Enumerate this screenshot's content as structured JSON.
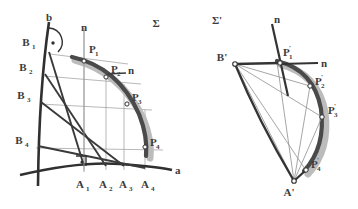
{
  "figure": {
    "kind": "descriptive-geometry-construction",
    "panels": [
      {
        "id": "left",
        "plane_label": "Σ",
        "axis_labels": {
          "horizontal": "a",
          "vertical": "b",
          "normal": "n",
          "normal_secondary": "n"
        },
        "b_points": [
          {
            "label": "B",
            "sub": "1"
          },
          {
            "label": "B",
            "sub": "2"
          },
          {
            "label": "B",
            "sub": "3"
          },
          {
            "label": "B",
            "sub": "4"
          }
        ],
        "a_points": [
          {
            "label": "A",
            "sub": "1"
          },
          {
            "label": "A",
            "sub": "2"
          },
          {
            "label": "A",
            "sub": "3"
          },
          {
            "label": "A",
            "sub": "4"
          }
        ],
        "curve_points": [
          {
            "label": "P",
            "sub": "1"
          },
          {
            "label": "P",
            "sub": "2"
          },
          {
            "label": "P",
            "sub": "3"
          },
          {
            "label": "P",
            "sub": "4"
          }
        ]
      },
      {
        "id": "right",
        "plane_label": "Σ'",
        "axis_labels": {
          "normal": "n",
          "normal_secondary": "n"
        },
        "vertex_points": [
          {
            "label": "B'",
            "sub": ""
          },
          {
            "label": "A'",
            "sub": ""
          }
        ],
        "curve_points": [
          {
            "label": "P",
            "sub": "1",
            "prime": "'"
          },
          {
            "label": "P",
            "sub": "2",
            "prime": "'"
          },
          {
            "label": "P",
            "sub": "3",
            "prime": "'"
          },
          {
            "label": "P",
            "sub": "4",
            "prime": "'"
          }
        ]
      }
    ],
    "colors": {
      "ink": "#3c3c3c",
      "ink_strong": "#2b2b2b",
      "thin_line": "#8a8a8a",
      "band_dark": "#4d4d4d",
      "band_light": "#b4b4b4",
      "paper": "#ffffff"
    }
  }
}
